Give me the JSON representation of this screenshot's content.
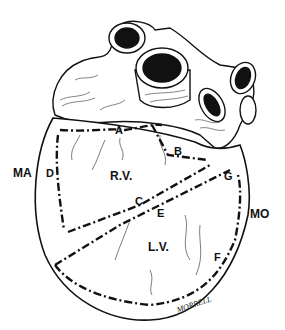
{
  "figure": {
    "regions": [
      {
        "id": "rv",
        "label": "R.V."
      },
      {
        "id": "lv",
        "label": "L.V."
      }
    ],
    "margins": [
      {
        "id": "ma",
        "label": "MA"
      },
      {
        "id": "mo",
        "label": "MO"
      }
    ],
    "points": [
      {
        "id": "a",
        "label": "A"
      },
      {
        "id": "b",
        "label": "B"
      },
      {
        "id": "c",
        "label": "C"
      },
      {
        "id": "d",
        "label": "D"
      },
      {
        "id": "e",
        "label": "E"
      },
      {
        "id": "f",
        "label": "F"
      },
      {
        "id": "g",
        "label": "G"
      }
    ],
    "signature": "MORRELL"
  }
}
